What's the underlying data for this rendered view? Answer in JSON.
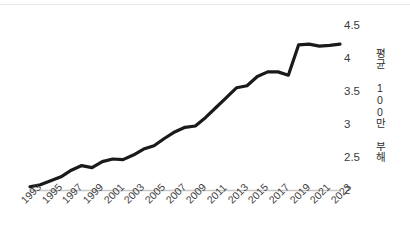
{
  "chart_data": {
    "type": "line",
    "title": "",
    "xlabel": "",
    "ylabel": "평균 100만 부해",
    "x": [
      1993,
      1994,
      1995,
      1996,
      1997,
      1998,
      1999,
      2000,
      2001,
      2002,
      2003,
      2004,
      2005,
      2006,
      2007,
      2008,
      2009,
      2010,
      2011,
      2012,
      2013,
      2014,
      2015,
      2016,
      2017,
      2018,
      2019,
      2020,
      2021,
      2022,
      2023
    ],
    "values": [
      2.05,
      2.08,
      2.14,
      2.2,
      2.3,
      2.37,
      2.34,
      2.43,
      2.47,
      2.46,
      2.53,
      2.62,
      2.67,
      2.78,
      2.88,
      2.95,
      2.97,
      3.1,
      3.25,
      3.4,
      3.55,
      3.58,
      3.72,
      3.79,
      3.79,
      3.74,
      4.2,
      4.21,
      4.18,
      4.19,
      4.21
    ],
    "series": [
      {
        "name": "평균 100만 부해",
        "values": [
          2.05,
          2.08,
          2.14,
          2.2,
          2.3,
          2.37,
          2.34,
          2.43,
          2.47,
          2.46,
          2.53,
          2.62,
          2.67,
          2.78,
          2.88,
          2.95,
          2.97,
          3.1,
          3.25,
          3.4,
          3.55,
          3.58,
          3.72,
          3.79,
          3.79,
          3.74,
          4.2,
          4.21,
          4.18,
          4.19,
          4.21
        ],
        "color": "#1a1a1a"
      }
    ],
    "points": [
      {
        "x": 1993,
        "y": 2.05
      },
      {
        "x": 1994,
        "y": 2.08
      },
      {
        "x": 1995,
        "y": 2.14
      },
      {
        "x": 1996,
        "y": 2.2
      },
      {
        "x": 1997,
        "y": 2.3
      },
      {
        "x": 1998,
        "y": 2.37
      },
      {
        "x": 1999,
        "y": 2.34
      },
      {
        "x": 2000,
        "y": 2.43
      },
      {
        "x": 2001,
        "y": 2.47
      },
      {
        "x": 2002,
        "y": 2.46
      },
      {
        "x": 2003,
        "y": 2.53
      },
      {
        "x": 2004,
        "y": 2.62
      },
      {
        "x": 2005,
        "y": 2.67
      },
      {
        "x": 2006,
        "y": 2.78
      },
      {
        "x": 2007,
        "y": 2.88
      },
      {
        "x": 2008,
        "y": 2.95
      },
      {
        "x": 2009,
        "y": 2.97
      },
      {
        "x": 2010,
        "y": 3.1
      },
      {
        "x": 2011,
        "y": 3.25
      },
      {
        "x": 2012,
        "y": 3.4
      },
      {
        "x": 2013,
        "y": 3.55
      },
      {
        "x": 2014,
        "y": 3.58
      },
      {
        "x": 2015,
        "y": 3.72
      },
      {
        "x": 2016,
        "y": 3.79
      },
      {
        "x": 2017,
        "y": 3.79
      },
      {
        "x": 2018,
        "y": 3.74
      },
      {
        "x": 2019,
        "y": 4.2
      },
      {
        "x": 2020,
        "y": 4.21
      },
      {
        "x": 2021,
        "y": 4.18
      },
      {
        "x": 2022,
        "y": 4.19
      },
      {
        "x": 2023,
        "y": 4.21
      }
    ],
    "ylim": [
      2,
      4.5
    ],
    "xlim": [
      1993,
      2023
    ],
    "yticks": [
      "4.5",
      "4",
      "3.5",
      "3",
      "2.5",
      "2"
    ],
    "ytick_values": [
      4.5,
      4,
      3.5,
      3,
      2.5,
      2
    ],
    "xticks": [
      "1993",
      "1995",
      "1997",
      "1999",
      "2001",
      "2003",
      "2005",
      "2007",
      "2009",
      "2011",
      "2013",
      "2015",
      "2017",
      "2019",
      "2021",
      "2023"
    ],
    "xtick_values": [
      1993,
      1995,
      1997,
      1999,
      2001,
      2003,
      2005,
      2007,
      2009,
      2011,
      2013,
      2015,
      2017,
      2019,
      2021,
      2023
    ],
    "grid": false,
    "legend": false,
    "legend_position": "none",
    "line_color": "#1a1a1a",
    "line_width": 3.2,
    "axis_color": "#c8c8c8",
    "background": "#ffffff"
  }
}
